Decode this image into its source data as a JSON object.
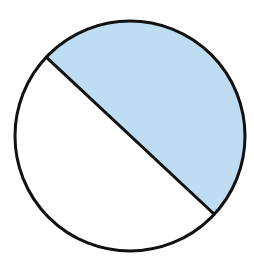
{
  "diagram": {
    "type": "circle-fraction",
    "shaded_fraction_label": "1/2",
    "parts_total": 2,
    "parts_shaded": 1,
    "circle": {
      "cx": 130,
      "cy": 136,
      "r": 115
    },
    "chord": {
      "x1": 46,
      "y1": 57,
      "x2": 214,
      "y2": 214
    },
    "colors": {
      "shaded_fill": "#BEDCF2",
      "unshaded_fill": "#FFFFFF",
      "stroke": "#111111",
      "background": "#FFFFFF"
    },
    "stroke_width": 3
  }
}
